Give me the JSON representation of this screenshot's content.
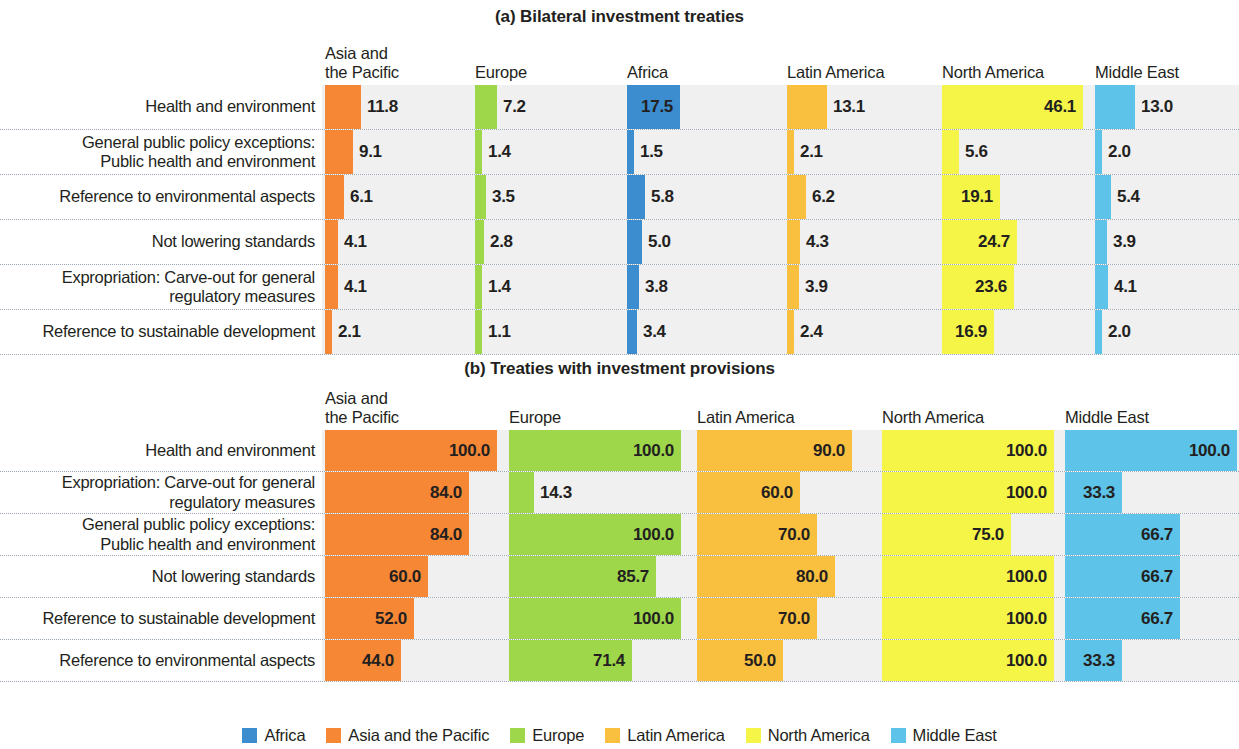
{
  "figure": {
    "legend": {
      "position": "bottom-center",
      "items": [
        {
          "label": "Africa",
          "color": "#3c8dd0"
        },
        {
          "label": "Asia and the Pacific",
          "color": "#f58735"
        },
        {
          "label": "Europe",
          "color": "#9ed84a"
        },
        {
          "label": "Latin America",
          "color": "#f9bf3f"
        },
        {
          "label": "North America",
          "color": "#f5f548"
        },
        {
          "label": "Middle East",
          "color": "#5dc3e8"
        }
      ]
    }
  },
  "chart_data": [
    {
      "type": "bar",
      "title": "(a) Bilateral investment treaties",
      "xlabel": "",
      "ylabel": "",
      "xlim": [
        0,
        100
      ],
      "grid": false,
      "orientation": "horizontal",
      "value_format": "one-decimal percentage",
      "categories": [
        "Health and environment",
        "General public policy exceptions:\nPublic health and environment",
        "Reference to environmental aspects",
        "Not lowering standards",
        "Expropriation: Carve-out for general\nregulatory measures",
        "Reference to sustainable development"
      ],
      "column_headers": [
        "Asia and\nthe Pacific",
        "Europe",
        "Africa",
        "Latin America",
        "North America",
        "Middle East"
      ],
      "series": [
        {
          "name": "Asia and the Pacific",
          "color": "#f58735",
          "values": [
            11.8,
            9.1,
            6.1,
            4.1,
            4.1,
            2.1
          ]
        },
        {
          "name": "Europe",
          "color": "#9ed84a",
          "values": [
            7.2,
            1.4,
            3.5,
            2.8,
            1.4,
            1.1
          ]
        },
        {
          "name": "Africa",
          "color": "#3c8dd0",
          "values": [
            17.5,
            1.5,
            5.8,
            5.0,
            3.8,
            3.4
          ]
        },
        {
          "name": "Latin America",
          "color": "#f9bf3f",
          "values": [
            13.1,
            2.1,
            6.2,
            4.3,
            3.9,
            2.4
          ]
        },
        {
          "name": "North America",
          "color": "#f5f548",
          "values": [
            46.1,
            5.6,
            19.1,
            24.7,
            23.6,
            16.9
          ]
        },
        {
          "name": "Middle East",
          "color": "#5dc3e8",
          "values": [
            13.0,
            2.0,
            5.4,
            3.9,
            4.1,
            2.0
          ]
        }
      ],
      "labels": [
        [
          "11.8",
          "7.2",
          "17.5",
          "13.1",
          "46.1",
          "13.0"
        ],
        [
          "9.1",
          "1.4",
          "1.5",
          "2.1",
          "5.6",
          "2.0"
        ],
        [
          "6.1",
          "3.5",
          "5.8",
          "6.2",
          "19.1",
          "5.4"
        ],
        [
          "4.1",
          "2.8",
          "5.0",
          "4.3",
          "24.7",
          "3.9"
        ],
        [
          "4.1",
          "1.4",
          "3.8",
          "3.9",
          "23.6",
          "4.1"
        ],
        [
          "2.1",
          "1.1",
          "3.4",
          "2.4",
          "16.9",
          "2.0"
        ]
      ]
    },
    {
      "type": "bar",
      "title": "(b) Treaties with investment provisions",
      "xlabel": "",
      "ylabel": "",
      "xlim": [
        0,
        100
      ],
      "grid": false,
      "orientation": "horizontal",
      "value_format": "one-decimal percentage",
      "categories": [
        "Health and environment",
        "Expropriation: Carve-out for general\nregulatory measures",
        "General public policy exceptions:\nPublic health and environment",
        "Not lowering standards",
        "Reference to sustainable development",
        "Reference to environmental aspects"
      ],
      "column_headers": [
        "Asia and\nthe Pacific",
        "Europe",
        "Latin America",
        "North America",
        "Middle East"
      ],
      "series": [
        {
          "name": "Asia and the Pacific",
          "color": "#f58735",
          "values": [
            100.0,
            84.0,
            84.0,
            60.0,
            52.0,
            44.0
          ]
        },
        {
          "name": "Europe",
          "color": "#9ed84a",
          "values": [
            100.0,
            14.3,
            100.0,
            85.7,
            100.0,
            71.4
          ]
        },
        {
          "name": "Latin America",
          "color": "#f9bf3f",
          "values": [
            90.0,
            60.0,
            70.0,
            80.0,
            70.0,
            50.0
          ]
        },
        {
          "name": "North America",
          "color": "#f5f548",
          "values": [
            100.0,
            100.0,
            75.0,
            100.0,
            100.0,
            100.0
          ]
        },
        {
          "name": "Middle East",
          "color": "#5dc3e8",
          "values": [
            100.0,
            33.3,
            66.7,
            66.7,
            66.7,
            33.3
          ]
        }
      ],
      "labels": [
        [
          "100.0",
          "100.0",
          "90.0",
          "100.0",
          "100.0"
        ],
        [
          "84.0",
          "14.3",
          "60.0",
          "100.0",
          "33.3"
        ],
        [
          "84.0",
          "100.0",
          "70.0",
          "75.0",
          "66.7"
        ],
        [
          "60.0",
          "85.7",
          "80.0",
          "100.0",
          "66.7"
        ],
        [
          "52.0",
          "100.0",
          "70.0",
          "100.0",
          "66.7"
        ],
        [
          "44.0",
          "71.4",
          "50.0",
          "100.0",
          "33.3"
        ]
      ]
    }
  ]
}
